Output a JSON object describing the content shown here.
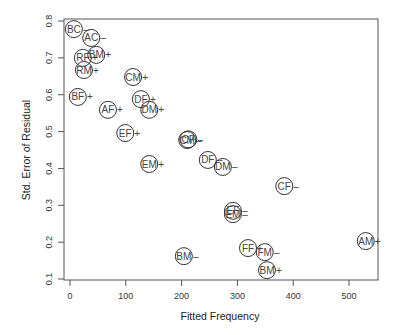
{
  "chart_data": {
    "type": "scatter",
    "title": "",
    "xlabel": "Fitted Frequency",
    "ylabel": "Std. Error of Residual",
    "xlim": [
      -10,
      555
    ],
    "ylim": [
      0.1,
      0.8
    ],
    "xticks": [
      0,
      100,
      200,
      300,
      400,
      500
    ],
    "yticks": [
      0.1,
      0.2,
      0.3,
      0.4,
      0.5,
      0.6,
      0.7,
      0.8
    ],
    "grid": false,
    "legend": null,
    "marker": "open circle with text label and sign",
    "points": [
      {
        "label": "BC",
        "sign": "-",
        "x": 7,
        "y": 0.778
      },
      {
        "label": "AC",
        "sign": "-",
        "x": 38,
        "y": 0.754
      },
      {
        "label": "RF",
        "sign": "+",
        "x": 23,
        "y": 0.7
      },
      {
        "label": "BM",
        "sign": "+",
        "x": 47,
        "y": 0.708
      },
      {
        "label": "RM",
        "sign": "+",
        "x": 25,
        "y": 0.667
      },
      {
        "label": "CM",
        "sign": "+",
        "x": 113,
        "y": 0.648
      },
      {
        "label": "BF",
        "sign": "+",
        "x": 14,
        "y": 0.594
      },
      {
        "label": "AF",
        "sign": "+",
        "x": 68,
        "y": 0.559
      },
      {
        "label": "DF",
        "sign": "+",
        "x": 127,
        "y": 0.588
      },
      {
        "label": "DM",
        "sign": "+",
        "x": 142,
        "y": 0.559
      },
      {
        "label": "EF",
        "sign": "+",
        "x": 99,
        "y": 0.496
      },
      {
        "label": "EM",
        "sign": "+",
        "x": 142,
        "y": 0.412
      },
      {
        "label": "CM",
        "sign": "-",
        "x": 210,
        "y": 0.477
      },
      {
        "label": "CF",
        "sign": "-",
        "x": 212,
        "y": 0.479
      },
      {
        "label": "DF",
        "sign": "-",
        "x": 247,
        "y": 0.423
      },
      {
        "label": "DM",
        "sign": "-",
        "x": 274,
        "y": 0.404
      },
      {
        "label": "CF",
        "sign": "-",
        "x": 384,
        "y": 0.352
      },
      {
        "label": "EF",
        "sign": "-",
        "x": 292,
        "y": 0.285
      },
      {
        "label": "EM",
        "sign": "-",
        "x": 292,
        "y": 0.276
      },
      {
        "label": "BM",
        "sign": "-",
        "x": 204,
        "y": 0.162
      },
      {
        "label": "FF",
        "sign": "+",
        "x": 319,
        "y": 0.184
      },
      {
        "label": "FM",
        "sign": "-",
        "x": 349,
        "y": 0.173
      },
      {
        "label": "BM",
        "sign": "+",
        "x": 353,
        "y": 0.124
      },
      {
        "label": "AM",
        "sign": "+",
        "x": 530,
        "y": 0.203
      }
    ]
  },
  "colors": {
    "axis": "#444444",
    "marker": "#333333",
    "text": "#333333"
  }
}
